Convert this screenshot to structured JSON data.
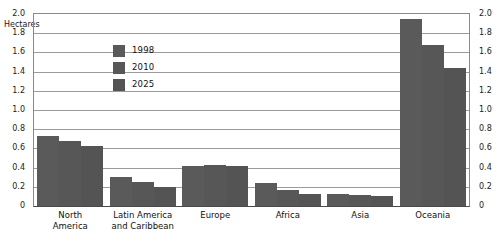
{
  "chart_data": {
    "type": "bar",
    "title": "",
    "subtitle": "",
    "xlabel": "",
    "ylabel": "Hectares",
    "units_label": "Hectares",
    "ylim": [
      0,
      2.0
    ],
    "ytick_step": 0.2,
    "grid": true,
    "legend_position": "inside-top-left",
    "dual_axis": true,
    "categories": [
      "North\nAmerica",
      "Latin America\nand Caribbean",
      "Europe",
      "Africa",
      "Asia",
      "Oceania"
    ],
    "yticks_left": [
      "2.0",
      "1.8",
      "1.6",
      "1.4",
      "1.2",
      "1.0",
      "0.8",
      "0.6",
      "0.4",
      "0.2",
      "0"
    ],
    "yticks_right": [
      "2.0",
      "1.8",
      "1.6",
      "1.4",
      "1.2",
      "1.0",
      "0.8",
      "0.6",
      "0.4",
      "0.2",
      "0"
    ],
    "series": [
      {
        "name": "1998",
        "color": "#5a5a5a",
        "values": [
          0.73,
          0.3,
          0.42,
          0.24,
          0.13,
          1.95
        ]
      },
      {
        "name": "2010",
        "color": "#575757",
        "values": [
          0.68,
          0.25,
          0.43,
          0.17,
          0.11,
          1.68
        ]
      },
      {
        "name": "2025",
        "color": "#545454",
        "values": [
          0.62,
          0.2,
          0.42,
          0.13,
          0.1,
          1.44
        ]
      }
    ]
  },
  "legend": {
    "items": [
      {
        "label": "1998"
      },
      {
        "label": "2010"
      },
      {
        "label": "2025"
      }
    ]
  },
  "colors": {
    "bar_fill": "#585858",
    "gridline": "#9b9b9b",
    "axis": "#4a4a4a",
    "text": "#1a1a1a",
    "background": "#ffffff"
  }
}
